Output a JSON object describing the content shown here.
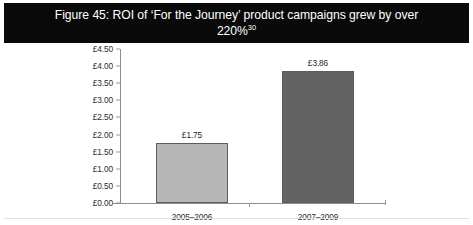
{
  "figure": {
    "title_line1": "Figure 45: ROI of ‘For the Journey’ product campaigns grew by over",
    "title_line2": "220%",
    "title_footnote": "30",
    "banner_color": "#0a0a0a",
    "banner_text_color": "#ffffff"
  },
  "chart_data": {
    "type": "bar",
    "title": "Figure 45: ROI of ‘For the Journey’ product campaigns grew by over 220%",
    "categories": [
      "2005–2006",
      "2007–2009"
    ],
    "values": [
      1.75,
      3.86
    ],
    "value_labels": [
      "£1.75",
      "£3.86"
    ],
    "series": [
      {
        "name": "ROI",
        "values": [
          1.75,
          3.86
        ]
      }
    ],
    "xlabel": "",
    "ylabel": "",
    "ylim": [
      0,
      4.5
    ],
    "ytick_step": 0.5,
    "ytick_labels": [
      "£4.50",
      "£4.00",
      "£3.50",
      "£3.00",
      "£2.50",
      "£2.00",
      "£1.50",
      "£1.00",
      "£0.50",
      "£0.00"
    ],
    "ytick_values": [
      4.5,
      4.0,
      3.5,
      3.0,
      2.5,
      2.0,
      1.5,
      1.0,
      0.5,
      0.0
    ],
    "currency_symbol": "£",
    "grid": false,
    "legend": false,
    "bar_colors": [
      "#b7b7b7",
      "#636363"
    ],
    "bar_border_color": "#5c5c5c",
    "axis_color": "#8d8d8d"
  }
}
